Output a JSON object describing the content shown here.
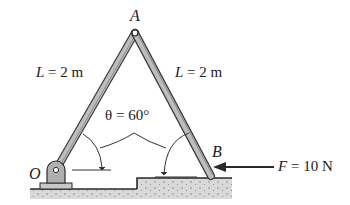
{
  "figure": {
    "labels": {
      "point_A": "A",
      "point_B": "B",
      "point_O": "O",
      "left_length": "L = 2 m",
      "right_length": "L = 2 m",
      "angle": "θ = 60°",
      "force": "F = 10 N"
    },
    "colors": {
      "bar_fill": "#b9b9b9",
      "bar_edge": "#3a3a3a",
      "ground_fill": "#d6d6d6",
      "line": "#2a2a2a"
    }
  }
}
